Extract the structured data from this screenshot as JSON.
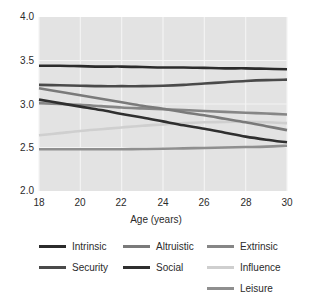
{
  "chart_data": {
    "type": "line",
    "title": "",
    "xlabel": "Age (years)",
    "ylabel": "",
    "xlim": [
      18,
      30
    ],
    "ylim": [
      2.0,
      4.0
    ],
    "xticks": [
      "18",
      "20",
      "22",
      "24",
      "26",
      "28",
      "30"
    ],
    "yticks": [
      "2.0",
      "2.5",
      "3.0",
      "3.5",
      "4.0"
    ],
    "grid": true,
    "legend_position": "bottom",
    "x": [
      18,
      19,
      20,
      21,
      22,
      23,
      24,
      25,
      26,
      27,
      28,
      29,
      30
    ],
    "series": [
      {
        "name": "Intrinsic",
        "color": "#2b2b2b",
        "values": [
          3.44,
          3.44,
          3.435,
          3.43,
          3.43,
          3.425,
          3.42,
          3.42,
          3.415,
          3.41,
          3.41,
          3.405,
          3.4
        ]
      },
      {
        "name": "Security",
        "color": "#4a4a4a",
        "values": [
          3.22,
          3.215,
          3.21,
          3.205,
          3.205,
          3.205,
          3.21,
          3.22,
          3.235,
          3.25,
          3.265,
          3.275,
          3.28
        ]
      },
      {
        "name": "Altruistic",
        "color": "#7a7a7a",
        "values": [
          3.18,
          3.14,
          3.1,
          3.06,
          3.02,
          2.98,
          2.945,
          2.905,
          2.87,
          2.83,
          2.79,
          2.745,
          2.7
        ]
      },
      {
        "name": "Social",
        "color": "#2f2f2f",
        "values": [
          3.05,
          3.01,
          2.97,
          2.93,
          2.885,
          2.845,
          2.8,
          2.755,
          2.715,
          2.67,
          2.625,
          2.59,
          2.56
        ]
      },
      {
        "name": "Extrinsic",
        "color": "#868686",
        "values": [
          3.01,
          3.0,
          2.99,
          2.975,
          2.96,
          2.95,
          2.94,
          2.93,
          2.92,
          2.91,
          2.9,
          2.89,
          2.88
        ]
      },
      {
        "name": "Influence",
        "color": "#cfcfcf",
        "values": [
          2.64,
          2.665,
          2.69,
          2.71,
          2.73,
          2.75,
          2.765,
          2.78,
          2.79,
          2.795,
          2.795,
          2.79,
          2.78
        ]
      },
      {
        "name": "Leisure",
        "color": "#8f8f8f",
        "values": [
          2.48,
          2.48,
          2.48,
          2.48,
          2.48,
          2.482,
          2.485,
          2.49,
          2.495,
          2.5,
          2.505,
          2.51,
          2.52
        ]
      }
    ]
  },
  "axis": {
    "xlabel": "Age (years)",
    "yticks": [
      "4.0",
      "3.5",
      "3.0",
      "2.5",
      "2.0"
    ],
    "xticks": [
      "18",
      "20",
      "22",
      "24",
      "26",
      "28",
      "30"
    ]
  },
  "legend": {
    "items": [
      {
        "label": "Intrinsic",
        "color": "#2b2b2b"
      },
      {
        "label": "Altruistic",
        "color": "#7a7a7a"
      },
      {
        "label": "Extrinsic",
        "color": "#868686"
      },
      {
        "label": "Security",
        "color": "#4a4a4a"
      },
      {
        "label": "Social",
        "color": "#2f2f2f"
      },
      {
        "label": "Influence",
        "color": "#cfcfcf"
      },
      {
        "label": "Leisure",
        "color": "#8f8f8f"
      }
    ]
  },
  "plot_style": {
    "background": "#e3e3e3",
    "gridline_color": "#f4f4f4",
    "text_color": "#2b2b2b"
  }
}
